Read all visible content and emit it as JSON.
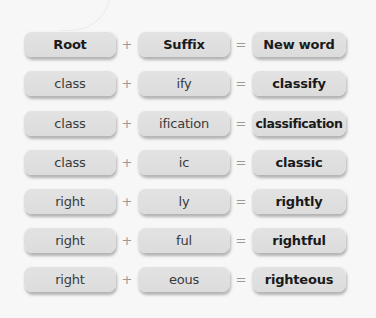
{
  "diagram": {
    "title": "Root + Suffix = New word",
    "header": {
      "root": "Root",
      "plus": "+",
      "suffix": "Suffix",
      "equals": "=",
      "result": "New word"
    },
    "rows": [
      {
        "root": "class",
        "plus": "+",
        "suffix": "ify",
        "equals": "=",
        "result": "classify"
      },
      {
        "root": "class",
        "plus": "+",
        "suffix": "ification",
        "equals": "=",
        "result": "classification"
      },
      {
        "root": "class",
        "plus": "+",
        "suffix": "ic",
        "equals": "=",
        "result": "classic"
      },
      {
        "root": "right",
        "plus": "+",
        "suffix": "ly",
        "equals": "=",
        "result": "rightly"
      },
      {
        "root": "right",
        "plus": "+",
        "suffix": "ful",
        "equals": "=",
        "result": "rightful"
      },
      {
        "root": "right",
        "plus": "+",
        "suffix": "eous",
        "equals": "=",
        "result": "righteous"
      }
    ],
    "colors": {
      "background": "#f7f7f7",
      "box": "#dfdfdf",
      "text": "#3a3a3a",
      "bold_text": "#1a1a1a",
      "operator": "#9a9a9a"
    }
  }
}
